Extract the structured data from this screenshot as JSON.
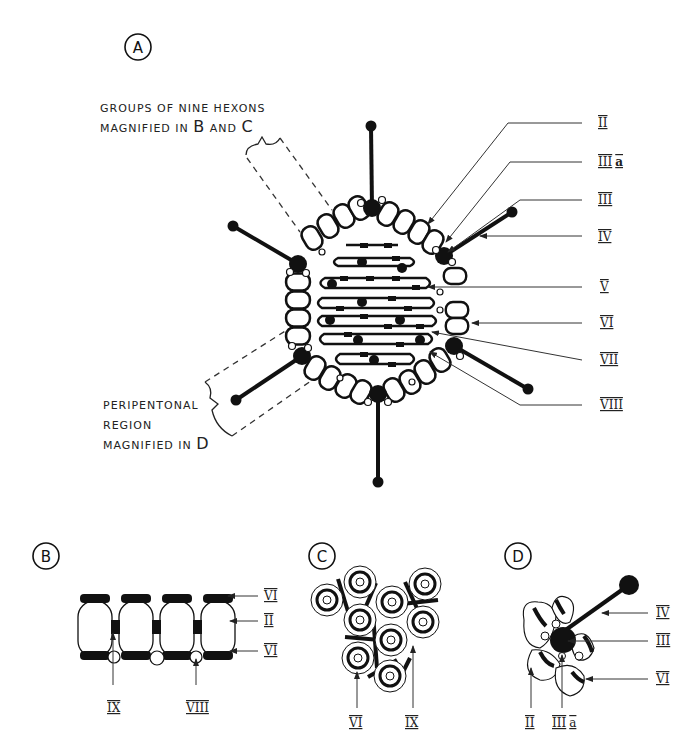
{
  "panels": {
    "A": {
      "label": "A",
      "annotation_top": {
        "line1": "GROUPS OF NINE HEXONS",
        "line2_prefix": "MAGNIFIED IN ",
        "line2_b": "B",
        "line2_mid": " AND ",
        "line2_c": "C"
      },
      "annotation_bottom": {
        "line1": "PERIPENTONAL",
        "line2": "REGION",
        "line3_prefix": "MAGNIFIED IN ",
        "line3_d": "D"
      },
      "callouts": [
        "II",
        "III",
        "III",
        "IV",
        "V",
        "VI",
        "VII",
        "VIII"
      ],
      "callout_suffix_a": "a"
    },
    "B": {
      "label": "B",
      "right_callouts": [
        "VI",
        "II",
        "VI"
      ],
      "bottom_callouts": [
        "IX",
        "VIII"
      ]
    },
    "C": {
      "label": "C",
      "bottom_callouts": [
        "VI",
        "IX"
      ]
    },
    "D": {
      "label": "D",
      "right_callouts": [
        "IV",
        "III",
        "VI"
      ],
      "bottom_callouts": [
        "II",
        "III"
      ],
      "bottom_suffix_a": "a"
    }
  },
  "colors": {
    "ink": "#111111",
    "background": "#ffffff"
  }
}
